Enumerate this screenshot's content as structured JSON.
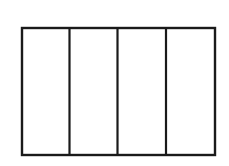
{
  "diagram": {
    "type": "rectangle-divided-into-equal-parts",
    "parts": 4,
    "orientation": "vertical-dividers",
    "stroke_color": "#1a1a1a",
    "fill_color": "#ffffff",
    "outer_rect": {
      "x": 21,
      "y": 27,
      "width": 194,
      "height": 128
    },
    "dividers_x": [
      69,
      117,
      166
    ]
  }
}
